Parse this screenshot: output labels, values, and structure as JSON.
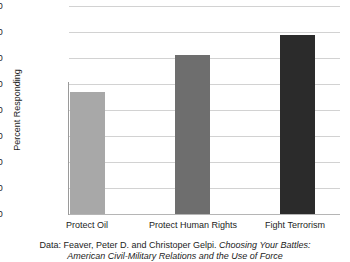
{
  "chart_data": {
    "type": "bar",
    "title": "",
    "xlabel": "",
    "ylabel": "Percent Responding",
    "categories": [
      "Protect Oil",
      "Protect Human Rights",
      "Fight Terrorism"
    ],
    "values": [
      47,
      61,
      69
    ],
    "ylim": [
      0,
      80
    ],
    "yticks": [
      0,
      10,
      20,
      30,
      40,
      50,
      60,
      70,
      80
    ],
    "ytick_labels": [
      "0",
      "10",
      "20",
      "30",
      "40",
      "50",
      "60",
      "70",
      "80"
    ],
    "grid": "horizontal",
    "legend": "none",
    "bar_colors": [
      "#a8a8a8",
      "#6e6e6e",
      "#2b2b2b"
    ],
    "series": [
      {
        "name": "Percent Responding",
        "values": [
          47,
          61,
          69
        ]
      }
    ]
  },
  "caption": {
    "line1_prefix": "Data: Feaver, Peter D. and Christoper Gelpi. ",
    "line1_italic": "Choosing Your Battles:",
    "line2_italic": "American Civil-Military Relations and the Use of Force"
  },
  "colors": {
    "gridline": "#d2d2d2",
    "axis": "#9a9a9a",
    "text": "#1c1c1c",
    "background": "#ffffff"
  }
}
